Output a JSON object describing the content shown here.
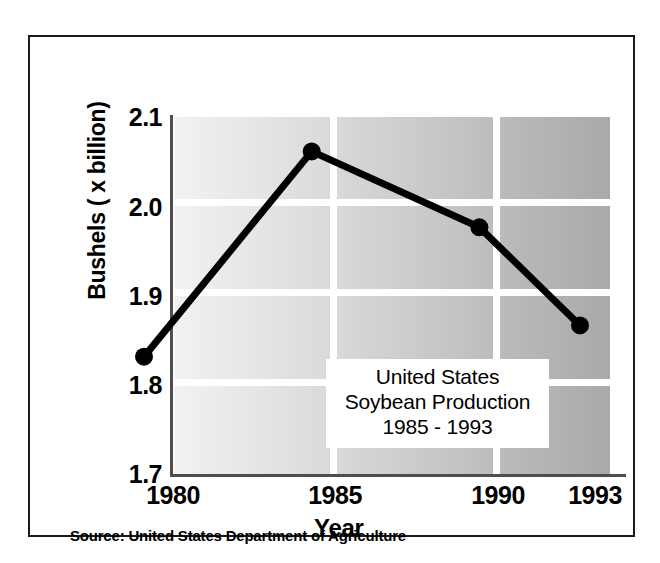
{
  "chart_data": {
    "type": "line",
    "title": "United States Soybean Production 1985 - 1993",
    "title_lines": [
      "United States",
      "Soybean Production",
      "1985 - 1993"
    ],
    "xlabel": "Year",
    "ylabel": "Bushels ( x billion)",
    "x": [
      1980,
      1985,
      1990,
      1993
    ],
    "categories": [
      "1980",
      "1985",
      "1990",
      "1993"
    ],
    "values": [
      1.79,
      2.02,
      1.935,
      1.825
    ],
    "series": [
      {
        "name": "United States Soybean Production",
        "values": [
          1.79,
          2.02,
          1.935,
          1.825
        ]
      }
    ],
    "xlim": [
      1980,
      1993
    ],
    "ylim": [
      1.7,
      2.1
    ],
    "ytick_labels": [
      "2.1",
      "2.0",
      "1.9",
      "1.8",
      "1.7"
    ],
    "ytick_values": [
      2.1,
      2.0,
      1.9,
      1.8,
      1.7
    ],
    "xtick_labels": [
      "1980",
      "1985",
      "1990",
      "1993"
    ],
    "grid": "white gridlines on gray gradient background",
    "legend": "none",
    "marker": "filled black circle",
    "line_color": "#000000",
    "source": "Source: United States Department of Agriculture"
  },
  "axes": {
    "y_title": "Bushels ( x billion)",
    "x_title": "Year",
    "y_ticks": [
      {
        "label": "2.1",
        "value": 2.1
      },
      {
        "label": "2.0",
        "value": 2.0
      },
      {
        "label": "1.9",
        "value": 1.9
      },
      {
        "label": "1.8",
        "value": 1.8
      },
      {
        "label": "1.7",
        "value": 1.7
      }
    ],
    "x_ticks": [
      {
        "label": "1980",
        "value": 1980
      },
      {
        "label": "1985",
        "value": 1985
      },
      {
        "label": "1990",
        "value": 1990
      },
      {
        "label": "1993",
        "value": 1993
      }
    ]
  },
  "title_box": {
    "line1": "United States",
    "line2": "Soybean Production",
    "line3": "1985 - 1993"
  },
  "footer": {
    "source": "Source: United States Department of Agriculture"
  },
  "colors": {
    "line": "#000000",
    "marker": "#000000",
    "frame": "#1a1a1a",
    "axis": "#4d4d4d",
    "gridline": "#ffffff",
    "plot_bg_light": "#f2f2f2",
    "plot_bg_dark": "#a9a9a9",
    "page_bg": "#ffffff"
  }
}
